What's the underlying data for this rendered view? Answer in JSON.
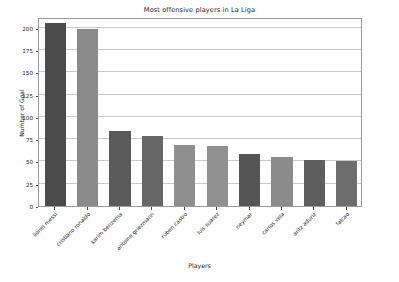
{
  "chart_data": {
    "type": "bar",
    "title": "Most offensive players in La Liga",
    "xlabel": "Players",
    "ylabel": "Number of Goal",
    "categories": [
      "lionel messi",
      "cristiano ronaldo",
      "karim benzema",
      "antoine griezmann",
      "ruben castro",
      "luis suarez",
      "neymar",
      "carlos vela",
      "aritz aduriz",
      "falcao"
    ],
    "values": [
      205,
      199,
      84,
      79,
      69,
      67,
      58,
      55,
      52,
      51
    ],
    "ylim": [
      0,
      212
    ],
    "yticks": [
      0,
      25,
      50,
      75,
      100,
      125,
      150,
      175,
      200
    ],
    "ytick_labels": [
      "0",
      "25",
      "50",
      "75",
      "100",
      "125",
      "150",
      "175",
      "200"
    ],
    "grid": true,
    "legend": "none",
    "bar_colors": [
      "#4b4b4b",
      "#8a8a8a",
      "#5a5a5a",
      "#666666",
      "#8f8f8f",
      "#909090",
      "#555555",
      "#8b8b8b",
      "#5e5e5e",
      "#6e6e6e"
    ]
  }
}
